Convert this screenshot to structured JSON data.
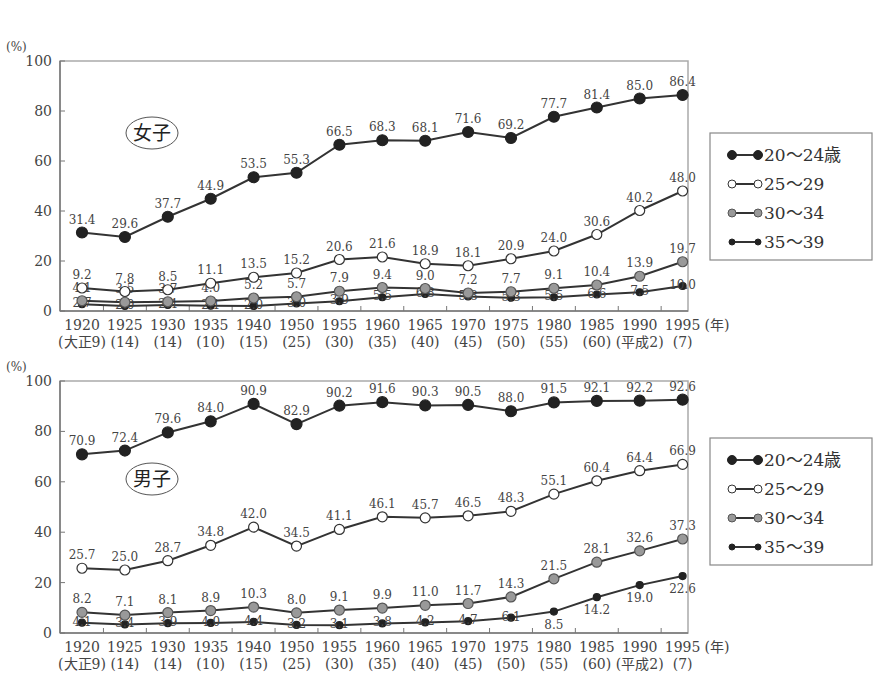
{
  "chart_data": [
    {
      "type": "line",
      "title": "女子",
      "ylabel": "(%)",
      "xlabel": "(年)",
      "ylim": [
        0,
        100
      ],
      "yticks": [
        0,
        20,
        40,
        60,
        80,
        100
      ],
      "grid": false,
      "legend_position": "right",
      "categories": [
        "1920",
        "1925",
        "1930",
        "1935",
        "1940",
        "1950",
        "1955",
        "1960",
        "1965",
        "1970",
        "1975",
        "1980",
        "1985",
        "1990",
        "1995"
      ],
      "era_labels": [
        "(大正9)",
        "(14)",
        "(14)",
        "(10)",
        "(15)",
        "(25)",
        "(30)",
        "(35)",
        "(40)",
        "(45)",
        "(50)",
        "(55)",
        "(60)",
        "(平成2)",
        "(7)"
      ],
      "series": [
        {
          "name": "20〜24歳",
          "marker": "large-black",
          "values": [
            31.4,
            29.6,
            37.7,
            44.9,
            53.5,
            55.3,
            66.5,
            68.3,
            68.1,
            71.6,
            69.2,
            77.7,
            81.4,
            85.0,
            86.4
          ]
        },
        {
          "name": "25〜29",
          "marker": "white",
          "values": [
            9.2,
            7.8,
            8.5,
            11.1,
            13.5,
            15.2,
            20.6,
            21.6,
            18.9,
            18.1,
            20.9,
            24.0,
            30.6,
            40.2,
            48.0
          ]
        },
        {
          "name": "30〜34",
          "marker": "gray",
          "values": [
            4.1,
            3.5,
            3.7,
            4.0,
            5.2,
            5.7,
            7.9,
            9.4,
            9.0,
            7.2,
            7.7,
            9.1,
            10.4,
            13.9,
            19.7
          ]
        },
        {
          "name": "35〜39",
          "marker": "small-black",
          "values": [
            2.7,
            2.0,
            2.4,
            2.1,
            2.0,
            3.0,
            3.9,
            5.5,
            6.8,
            5.8,
            5.3,
            5.5,
            6.6,
            7.5,
            10.0
          ]
        }
      ]
    },
    {
      "type": "line",
      "title": "男子",
      "ylabel": "(%)",
      "xlabel": "(年)",
      "ylim": [
        0,
        100
      ],
      "yticks": [
        0,
        20,
        40,
        60,
        80,
        100
      ],
      "grid": false,
      "legend_position": "right",
      "categories": [
        "1920",
        "1925",
        "1930",
        "1935",
        "1940",
        "1950",
        "1955",
        "1960",
        "1965",
        "1970",
        "1975",
        "1980",
        "1985",
        "1990",
        "1995"
      ],
      "era_labels": [
        "(大正9)",
        "(14)",
        "(14)",
        "(10)",
        "(15)",
        "(25)",
        "(30)",
        "(35)",
        "(40)",
        "(45)",
        "(50)",
        "(55)",
        "(60)",
        "(平成2)",
        "(7)"
      ],
      "series": [
        {
          "name": "20〜24歳",
          "marker": "large-black",
          "values": [
            70.9,
            72.4,
            79.6,
            84.0,
            90.9,
            82.9,
            90.2,
            91.6,
            90.3,
            90.5,
            88.0,
            91.5,
            92.1,
            92.2,
            92.6
          ]
        },
        {
          "name": "25〜29",
          "marker": "white",
          "values": [
            25.7,
            25.0,
            28.7,
            34.8,
            42.0,
            34.5,
            41.1,
            46.1,
            45.7,
            46.5,
            48.3,
            55.1,
            60.4,
            64.4,
            66.9
          ]
        },
        {
          "name": "30〜34",
          "marker": "gray",
          "values": [
            8.2,
            7.1,
            8.1,
            8.9,
            10.3,
            8.0,
            9.1,
            9.9,
            11.0,
            11.7,
            14.3,
            21.5,
            28.1,
            32.6,
            37.3
          ]
        },
        {
          "name": "35〜39",
          "marker": "small-black",
          "values": [
            4.1,
            3.4,
            3.9,
            4.0,
            4.4,
            3.2,
            3.1,
            3.8,
            4.2,
            4.7,
            6.1,
            8.5,
            14.2,
            19.0,
            22.6
          ]
        }
      ]
    }
  ],
  "colors": {
    "line": "#333333",
    "black_marker": "#222222",
    "gray_marker": "#999999",
    "white_marker": "#ffffff",
    "axis": "#888888"
  }
}
